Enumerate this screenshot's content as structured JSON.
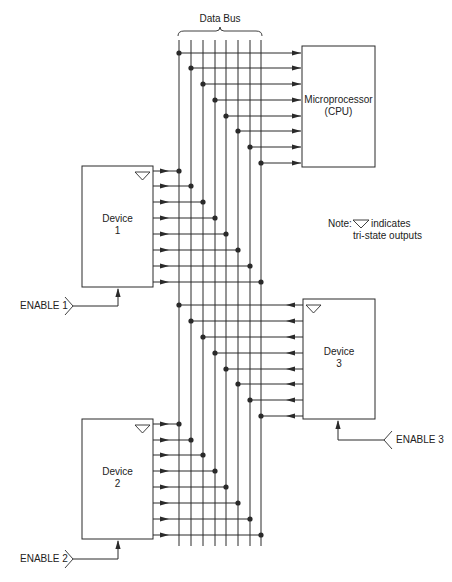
{
  "title": "Data Bus",
  "colors": {
    "line": "#2a2a2a",
    "text": "#222222",
    "background": "#ffffff"
  },
  "bus": {
    "label": "Data Bus",
    "lines_x": [
      179,
      191,
      203,
      215,
      226,
      238,
      250,
      261
    ],
    "y_top": 40,
    "y_bottom": 546,
    "brace": {
      "x1": 178,
      "x2": 262,
      "y": 31
    }
  },
  "cpu": {
    "name": "Microprocessor",
    "subname": "(CPU)",
    "box": {
      "x": 302,
      "y": 46,
      "w": 73,
      "h": 121
    },
    "rows_y": [
      53,
      68,
      84,
      100,
      116,
      131,
      147,
      163
    ],
    "direction": "in"
  },
  "devices": [
    {
      "name": "Device",
      "number": "1",
      "box": {
        "x": 82,
        "y": 166,
        "w": 71,
        "h": 121
      },
      "rows_y": [
        171,
        186,
        202,
        218,
        234,
        250,
        266,
        282
      ],
      "side": "right",
      "direction": "out",
      "enable": {
        "label": "ENABLE 1",
        "arrow_x": 118,
        "line_y": 306,
        "chevron_x": 73,
        "text_x": 20
      }
    },
    {
      "name": "Device",
      "number": "2",
      "box": {
        "x": 82,
        "y": 419,
        "w": 71,
        "h": 120
      },
      "rows_y": [
        424,
        440,
        455,
        471,
        487,
        503,
        519,
        535
      ],
      "side": "right",
      "direction": "out",
      "enable": {
        "label": "ENABLE 2",
        "arrow_x": 118,
        "line_y": 559,
        "chevron_x": 73,
        "text_x": 20
      }
    },
    {
      "name": "Device",
      "number": "3",
      "box": {
        "x": 303,
        "y": 299,
        "w": 72,
        "h": 120
      },
      "rows_y": [
        305,
        321,
        337,
        353,
        369,
        384,
        400,
        416
      ],
      "side": "left",
      "direction": "out",
      "enable": {
        "label": "ENABLE 3",
        "arrow_x": 338,
        "line_y": 440,
        "chevron_x": 384,
        "text_x": 395
      }
    }
  ],
  "note": {
    "prefix": "Note:",
    "suffix": "indicates",
    "line2": "tri-state outputs",
    "x": 328,
    "y": 218
  }
}
